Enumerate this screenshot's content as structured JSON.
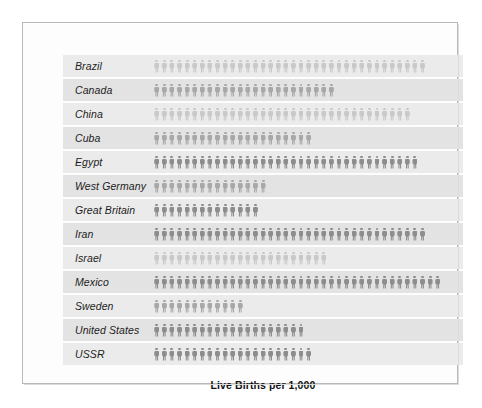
{
  "chart_data": {
    "type": "bar",
    "subtype": "pictograph",
    "title": "Live Births per 1,000",
    "xlabel": "",
    "ylabel": "",
    "unit_per_icon": 1,
    "icon": "person-icon",
    "categories": [
      "Brazil",
      "Canada",
      "China",
      "Cuba",
      "Egypt",
      "West Germany",
      "Great Britain",
      "Iran",
      "Israel",
      "Mexico",
      "Sweden",
      "United States",
      "USSR"
    ],
    "values": [
      36,
      24,
      34,
      21,
      35,
      15,
      14,
      36,
      23,
      38,
      12,
      20,
      21
    ],
    "rows": [
      {
        "label": "Brazil",
        "value": 36,
        "tone": "tone-light"
      },
      {
        "label": "Canada",
        "value": 24,
        "tone": "tone-mid"
      },
      {
        "label": "China",
        "value": 34,
        "tone": "tone-light"
      },
      {
        "label": "Cuba",
        "value": 21,
        "tone": "tone-mid"
      },
      {
        "label": "Egypt",
        "value": 35,
        "tone": "tone-dark"
      },
      {
        "label": "West Germany",
        "value": 15,
        "tone": "tone-mid"
      },
      {
        "label": "Great Britain",
        "value": 14,
        "tone": "tone-dark"
      },
      {
        "label": "Iran",
        "value": 36,
        "tone": "tone-dark"
      },
      {
        "label": "Israel",
        "value": 23,
        "tone": "tone-light"
      },
      {
        "label": "Mexico",
        "value": 38,
        "tone": "tone-dark"
      },
      {
        "label": "Sweden",
        "value": 12,
        "tone": "tone-mid"
      },
      {
        "label": "United States",
        "value": 20,
        "tone": "tone-dark"
      },
      {
        "label": "USSR",
        "value": 21,
        "tone": "tone-dark"
      }
    ],
    "grid": false,
    "legend": "none",
    "colors": {
      "icon_light": "#c9c9c9",
      "icon_mid": "#a8a8a8",
      "icon_dark": "#8d8d8d",
      "band_a": "#ebebeb",
      "band_b": "#e3e3e3",
      "frame_border": "#b9b9b9",
      "page_background": "#ffffff",
      "caption_text": "#111111"
    }
  }
}
